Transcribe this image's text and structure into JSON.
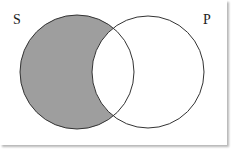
{
  "diagram": {
    "type": "venn",
    "sets": [
      {
        "label": "S",
        "shaded_region": "S only (outside P)"
      },
      {
        "label": "P",
        "shaded_region": "none"
      }
    ],
    "colors": {
      "shade": "#9e9e9e",
      "stroke": "#333333",
      "background": "#ffffff"
    }
  }
}
